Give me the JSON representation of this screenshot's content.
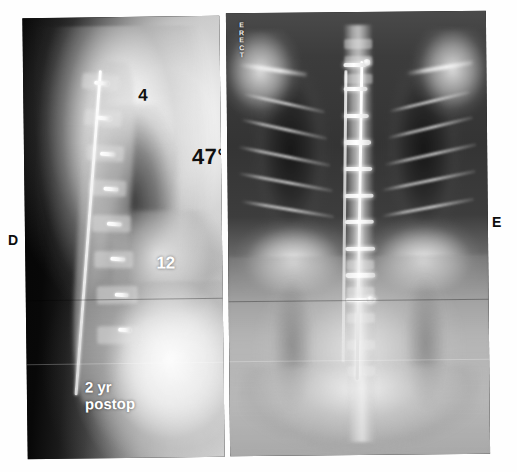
{
  "figure": {
    "type": "radiograph-figure",
    "panel_count": 2
  },
  "panels": [
    {
      "letter": "D",
      "view": "lateral",
      "name": "lateral-spine-radiograph",
      "annotations": {
        "upper_level": "4",
        "lower_level": "12",
        "angle": "47°",
        "timepoint_line1": "2 yr",
        "timepoint_line2": "postop"
      }
    },
    {
      "letter": "E",
      "view": "anteroposterior",
      "name": "ap-spine-radiograph",
      "marker": {
        "chars": [
          "E",
          "R",
          "E",
          "C",
          "T"
        ],
        "text": "ERECT"
      },
      "annotations": {
        "timepoint_line1": "2 yr",
        "timepoint_line2": "postop"
      }
    }
  ],
  "colors": {
    "background": "#ffffff",
    "caption_text": "#0d0d0d",
    "burned_in_text": "#ffffff",
    "dark_annotation_text": "#101010",
    "film_dark": "#0a0a0a",
    "hardware_bright": "#ffffff"
  }
}
